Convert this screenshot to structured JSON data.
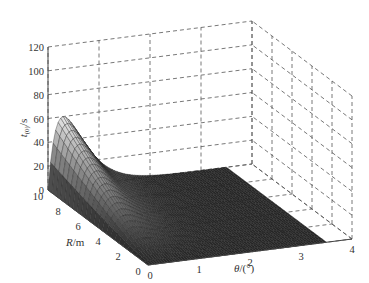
{
  "chart_data": {
    "type": "surface3d",
    "title": "",
    "xlabel": "θ/(°)",
    "ylabel": "R/m",
    "zlabel": "t_(0)/s",
    "x_ticks": [
      "0",
      "1",
      "2",
      "3",
      "4"
    ],
    "y_ticks": [
      "0",
      "2",
      "4",
      "6",
      "8",
      "10"
    ],
    "z_ticks": [
      "0",
      "20",
      "40",
      "60",
      "80",
      "100",
      "120"
    ],
    "xlim": [
      0,
      4
    ],
    "ylim": [
      0,
      10
    ],
    "zlim": [
      0,
      120
    ],
    "grid": true,
    "surface_samples": [
      {
        "theta": 0.0,
        "R": 10,
        "t": 0
      },
      {
        "theta": 0.15,
        "R": 10,
        "t": 45
      },
      {
        "theta": 0.3,
        "R": 10,
        "t": 58
      },
      {
        "theta": 0.6,
        "R": 10,
        "t": 50
      },
      {
        "theta": 1.0,
        "R": 10,
        "t": 20
      },
      {
        "theta": 1.5,
        "R": 10,
        "t": 3
      },
      {
        "theta": 2.0,
        "R": 10,
        "t": 0
      },
      {
        "theta": 3.5,
        "R": 10,
        "t": 0
      },
      {
        "theta": 0.3,
        "R": 5,
        "t": 30
      },
      {
        "theta": 0.3,
        "R": 0,
        "t": 0
      }
    ]
  }
}
